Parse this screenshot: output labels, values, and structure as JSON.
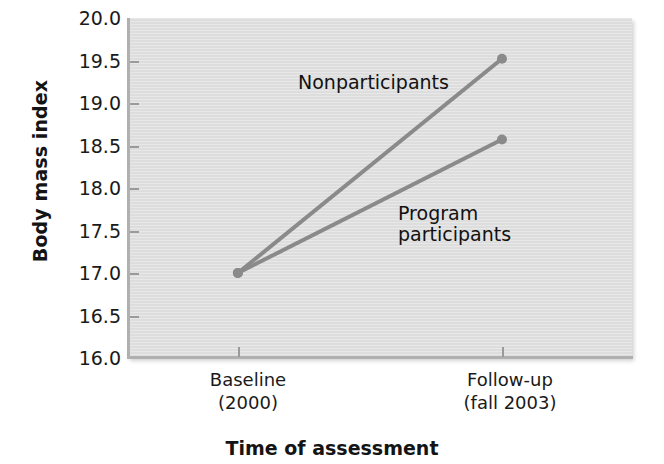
{
  "chart_data": {
    "type": "line",
    "title": "",
    "xlabel": "Time of assessment",
    "ylabel": "Body mass index",
    "categories": [
      "Baseline\n(2000)",
      "Follow-up\n(fall 2003)"
    ],
    "x_tick_labels": [
      {
        "line1": "Baseline",
        "line2": "(2000)"
      },
      {
        "line1": "Follow-up",
        "line2": "(fall 2003)"
      }
    ],
    "y_tick_labels": [
      "20.0",
      "19.5",
      "19.0",
      "18.5",
      "18.0",
      "17.5",
      "17.0",
      "16.5",
      "16.0"
    ],
    "y_tick_values": [
      20.0,
      19.5,
      19.0,
      18.5,
      18.0,
      17.5,
      17.0,
      16.5,
      16.0
    ],
    "ylim": [
      16.0,
      20.0
    ],
    "grid": false,
    "legend_position": "inline-annotation",
    "plot_background": "#dddddd",
    "series_color": "#8a8a8a",
    "marker": "circle",
    "series": [
      {
        "name": "Nonparticipants",
        "label": "Nonparticipants",
        "values": [
          17.0,
          19.52
        ],
        "color": "#8a8a8a"
      },
      {
        "name": "Program participants",
        "label_line1": "Program",
        "label_line2": "participants",
        "label": "Program participants",
        "values": [
          17.0,
          18.57
        ],
        "color": "#8a8a8a"
      }
    ]
  },
  "axes": {
    "y_title": "Body mass index",
    "x_title": "Time of assessment"
  }
}
